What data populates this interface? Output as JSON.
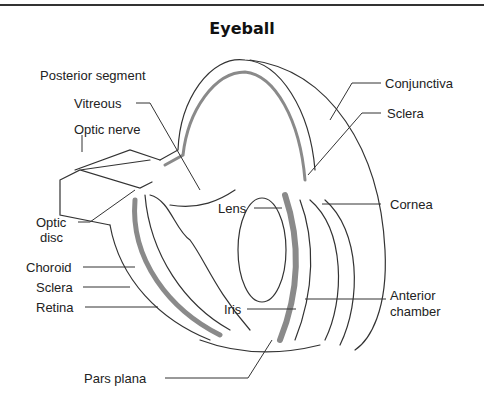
{
  "title": "Eyeball",
  "labels": {
    "posterior_segment": "Posterior segment",
    "vitreous": "Vitreous",
    "optic_nerve": "Optic nerve",
    "optic_disc_line1": "Optic",
    "optic_disc_line2": "disc",
    "choroid": "Choroid",
    "sclera_left": "Sclera",
    "retina": "Retina",
    "pars_plana": "Pars plana",
    "lens": "Lens",
    "iris": "Iris",
    "conjunctiva": "Conjunctiva",
    "sclera_right": "Sclera",
    "cornea": "Cornea",
    "anterior_chamber_line1": "Anterior",
    "anterior_chamber_line2": "chamber"
  },
  "colors": {
    "line": "#333333",
    "layer_shading": "#8a8a8a",
    "background": "#ffffff"
  }
}
